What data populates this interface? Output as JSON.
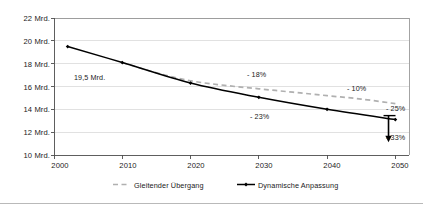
{
  "chart_data": {
    "type": "line",
    "title": "",
    "subtitle": "",
    "xlabel": "",
    "ylabel": "",
    "xlim": [
      2000,
      2052
    ],
    "ylim": [
      10,
      22
    ],
    "xticks": [
      "2000",
      "2010",
      "2020",
      "2030",
      "2040",
      "2050"
    ],
    "xtick_values": [
      2000,
      2010,
      2020,
      2030,
      2040,
      2050
    ],
    "yticks": [
      "10 Mrd.",
      "12 Mrd.",
      "14 Mrd.",
      "16 Mrd.",
      "18 Mrd.",
      "20 Mrd.",
      "22 Mrd."
    ],
    "ytick_values": [
      10,
      12,
      14,
      16,
      18,
      20,
      22
    ],
    "grid": "horizontal",
    "legend_position": "bottom",
    "series": [
      {
        "name": "Gleitender Übergang",
        "style": "dashed",
        "color": "#b0b0b0",
        "markers": false,
        "x": [
          2010,
          2015,
          2020,
          2025,
          2030,
          2035,
          2040,
          2045,
          2050
        ],
        "values": [
          18.1,
          17.2,
          16.5,
          16.1,
          15.8,
          15.5,
          15.2,
          14.9,
          14.5
        ]
      },
      {
        "name": "Dynamische Anpassung",
        "style": "solid",
        "color": "#000000",
        "markers": true,
        "x": [
          2002,
          2010,
          2020,
          2030,
          2040,
          2050
        ],
        "values": [
          19.5,
          18.1,
          16.3,
          15.05,
          14.0,
          13.1
        ]
      }
    ],
    "annotations": [
      {
        "text": "19,5 Mrd.",
        "x": 2007,
        "y": 16.6
      },
      {
        "text": "- 18%",
        "x": 2032,
        "y": 17.0
      },
      {
        "text": "- 10%",
        "x": 2043,
        "y": 16.2
      },
      {
        "text": "- 23%",
        "x": 2033,
        "y": 12.9
      },
      {
        "text": "- 25%",
        "x": 2050.5,
        "y": 14.0
      },
      {
        "text": "- 33%",
        "x": 2050.5,
        "y": 11.3
      }
    ],
    "arrow": {
      "x": 2049,
      "y_from": 13.45,
      "y_to": 11.3,
      "direction": "down",
      "cap": "tee"
    }
  },
  "legend": {
    "items": [
      {
        "label": "Gleitender Übergang",
        "style": "dashed",
        "color": "#b0b0b0"
      },
      {
        "label": "Dynamische Anpassung",
        "style": "solid",
        "color": "#000000"
      }
    ]
  },
  "colors": {
    "axis": "#4d4d4d",
    "grid": "#d9d9d9",
    "plot_border": "#8c8c8c",
    "series_dashed": "#b0b0b0",
    "series_solid": "#000000",
    "text": "#1a1a1a",
    "background": "#ffffff",
    "bottom_rule": "#b9b9b9"
  }
}
